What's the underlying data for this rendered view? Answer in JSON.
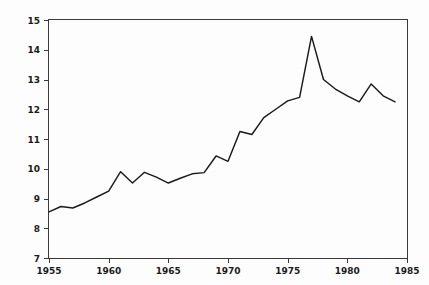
{
  "chart_data": {
    "type": "line",
    "title": "",
    "xlabel": "",
    "ylabel": "",
    "xlim": [
      1955,
      1985
    ],
    "ylim": [
      7,
      15
    ],
    "grid": false,
    "legend": null,
    "xticks": [
      1955,
      1960,
      1965,
      1970,
      1975,
      1980,
      1985
    ],
    "yticks": [
      7,
      8,
      9,
      10,
      11,
      12,
      13,
      14,
      15
    ],
    "xtick_labels": [
      "1955",
      "1960",
      "1965",
      "1970",
      "1975",
      "1980",
      "1985"
    ],
    "ytick_labels": [
      "7",
      "8",
      "9",
      "10",
      "11",
      "12",
      "13",
      "14",
      "15"
    ],
    "series": [
      {
        "name": "series-1",
        "color": "#1a1a1a",
        "x": [
          1955,
          1956,
          1957,
          1958,
          1959,
          1960,
          1961,
          1962,
          1963,
          1964,
          1965,
          1966,
          1967,
          1968,
          1969,
          1970,
          1971,
          1972,
          1973,
          1974,
          1975,
          1976,
          1977,
          1978,
          1979,
          1980,
          1981,
          1982,
          1983,
          1984
        ],
        "values": [
          8.55,
          8.73,
          8.68,
          8.85,
          9.05,
          9.25,
          9.9,
          9.52,
          9.88,
          9.72,
          9.52,
          9.68,
          9.83,
          9.87,
          10.43,
          10.25,
          11.25,
          11.15,
          11.72,
          12.0,
          12.28,
          12.4,
          14.45,
          13.0,
          12.68,
          12.45,
          12.25,
          12.85,
          12.45,
          12.25
        ]
      }
    ]
  },
  "axes": {
    "frame_color": "#3a3a3a",
    "background": "#fdfdfd"
  }
}
